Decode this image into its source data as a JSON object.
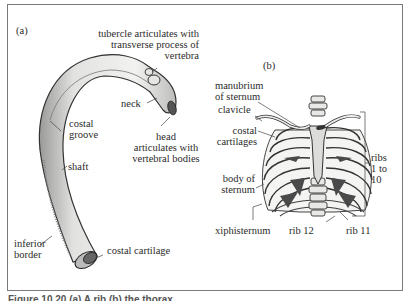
{
  "figure": {
    "caption": "Figure 10.20 (a) A rib (b) the thorax",
    "panels": [
      {
        "id": "a",
        "label": "(a)",
        "subject": "rib",
        "annotations": {
          "tubercle": "tubercle articulates with\ntransverse process of\nvertebra",
          "neck": "neck",
          "costal_groove": "costal\ngroove",
          "head": "head\narticulates with\nvertebral bodies",
          "shaft": "shaft",
          "inferior_border": "inferior\nborder",
          "costal_cartilage": "costal cartilage"
        }
      },
      {
        "id": "b",
        "label": "(b)",
        "subject": "thorax",
        "annotations": {
          "manubrium": "manubrium\nof sternum",
          "clavicle": "clavicle",
          "costal_cartilages": "costal\ncartilages",
          "body_of_sternum": "body of\nsternum",
          "xiphisternum": "xiphisternum",
          "rib12": "rib 12",
          "rib11": "rib 11",
          "ribs_range": "ribs\n1 to\n10"
        }
      }
    ]
  },
  "colors": {
    "frame": "#7a7a7a",
    "bone_fill": "#ececea",
    "bone_stroke": "#3a3a3a",
    "shadow": "#4a4a4a",
    "text": "#2b2b2b"
  }
}
